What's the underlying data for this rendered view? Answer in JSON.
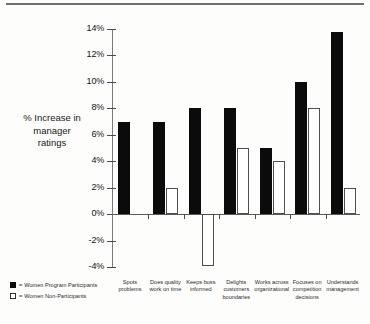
{
  "chart_data": {
    "type": "bar",
    "title": "",
    "xlabel": "",
    "ylabel": "% Increase in manager ratings",
    "ylim": [
      -4,
      14
    ],
    "ytick_labels": [
      "14%",
      "12%",
      "10%",
      "8%",
      "6%",
      "4%",
      "2%",
      "0%",
      "-2%",
      "-4%"
    ],
    "ytick_values": [
      14,
      12,
      10,
      8,
      6,
      4,
      2,
      0,
      -2,
      -4
    ],
    "grid": false,
    "legend_position": "bottom-left",
    "categories": [
      "Spots problems",
      "Does quality work on time",
      "Keeps boss informed",
      "Delights customers boundaries",
      "Works across organizational",
      "Focuses on competition decisions",
      "Understands management"
    ],
    "category_lines": [
      [
        "Spots",
        "problems"
      ],
      [
        "Does quality",
        "work on time"
      ],
      [
        "Keeps boss",
        "informed"
      ],
      [
        "Delights",
        "customers",
        "boundaries"
      ],
      [
        "Works across",
        "organizational"
      ],
      [
        "Focuses on",
        "competition",
        "decisions"
      ],
      [
        "Understands",
        "management"
      ]
    ],
    "series": [
      {
        "name": "Women Program Participants",
        "color": "#0b0b0b",
        "values": [
          7,
          7,
          8,
          8,
          5,
          10,
          13.8
        ]
      },
      {
        "name": "Women Non-Participants",
        "color": "#ffffff",
        "values": [
          null,
          2,
          -3.9,
          5,
          4,
          8,
          2
        ]
      }
    ]
  },
  "y_axis_title": {
    "line1": "% Increase in",
    "line2": "manager",
    "line3": "ratings"
  },
  "legend": {
    "separator": "=",
    "items": [
      {
        "label": "Women Program Participants",
        "swatch": "filled-black-square"
      },
      {
        "label": "Women Non-Participants",
        "swatch": "outlined-white-square"
      }
    ]
  }
}
